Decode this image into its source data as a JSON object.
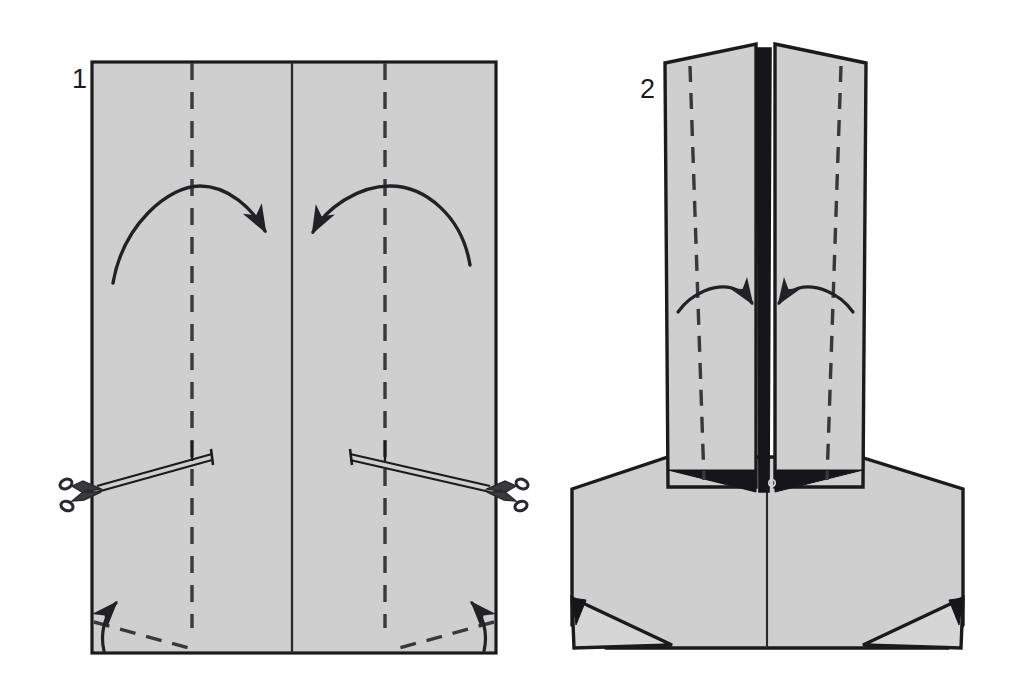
{
  "document": {
    "kind": "origami-folding-instructions",
    "title": "Paper folding diagram",
    "background_color": "#ffffff",
    "paper_fill": "#cfcfcf",
    "paper_fill_light": "#d6d6d6",
    "line_color": "#1b1b1b",
    "shadow_color": "#16161a",
    "dash_color": "#39393d"
  },
  "steps": [
    {
      "id": "step-1",
      "number": "1",
      "caption": "",
      "shape": "rectangle",
      "number_position": {
        "x": 72,
        "y": 87
      },
      "paper": {
        "x": 92,
        "y": 62,
        "width": 404,
        "height": 591
      },
      "creases": [
        {
          "name": "center-vertical-crease",
          "type": "solid",
          "x1": 292,
          "y1": 62,
          "x2": 292,
          "y2": 653
        },
        {
          "name": "left-valley-fold-line",
          "type": "dashed",
          "x1": 192,
          "y1": 62,
          "x2": 192,
          "y2": 628
        },
        {
          "name": "right-valley-fold-line",
          "type": "dashed",
          "x1": 385,
          "y1": 62,
          "x2": 385,
          "y2": 628
        }
      ],
      "fold_arrows": [
        {
          "name": "left-fold-arrow",
          "direction": "right",
          "label": "fold left panel toward center"
        },
        {
          "name": "right-fold-arrow",
          "direction": "left",
          "label": "fold right panel toward center"
        },
        {
          "name": "bottom-left-corner-arrow",
          "direction": "up-left",
          "label": "fold bottom-left corner up"
        },
        {
          "name": "bottom-right-corner-arrow",
          "direction": "up-right",
          "label": "fold bottom-right corner up"
        }
      ],
      "corner_fold_lines": [
        {
          "name": "bottom-left-corner-crease",
          "type": "dashed"
        },
        {
          "name": "bottom-right-corner-crease",
          "type": "dashed"
        }
      ],
      "cut_marks": [
        {
          "name": "left-cut-line",
          "side": "left",
          "tool": "scissors"
        },
        {
          "name": "right-cut-line",
          "side": "right",
          "tool": "scissors"
        }
      ]
    },
    {
      "id": "step-2",
      "number": "2",
      "caption": "",
      "shape": "folded-form",
      "number_position": {
        "x": 640,
        "y": 97
      },
      "creases": [
        {
          "name": "center-spine",
          "type": "solid-dark"
        },
        {
          "name": "left-panel-fold-line",
          "type": "dashed"
        },
        {
          "name": "right-panel-fold-line",
          "type": "dashed"
        },
        {
          "name": "body-center-line",
          "type": "solid"
        }
      ],
      "fold_arrows": [
        {
          "name": "left-panel-fold-arrow",
          "direction": "right",
          "label": "fold left flap inward"
        },
        {
          "name": "right-panel-fold-arrow",
          "direction": "left",
          "label": "fold right flap inward"
        }
      ],
      "shadow_regions": [
        {
          "name": "left-shoulder-shadow"
        },
        {
          "name": "right-shoulder-shadow"
        },
        {
          "name": "bottom-left-corner-shadow"
        },
        {
          "name": "bottom-right-corner-shadow"
        }
      ]
    }
  ]
}
